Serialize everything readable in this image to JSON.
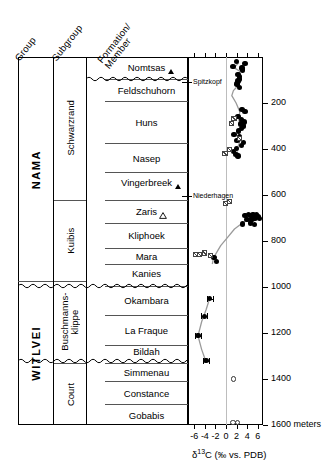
{
  "headers": {
    "group": "Group",
    "subgroup": "Subgroup",
    "formation_line1": "Formation/",
    "formation_line2": "Member"
  },
  "groups": [
    {
      "label": "NAMA",
      "top": 0,
      "bottom": 975
    },
    {
      "label": "WITLVEI",
      "top": 975,
      "bottom": 1600
    }
  ],
  "subgroups": [
    {
      "label": "Schwarzrand",
      "top": 0,
      "bottom": 620
    },
    {
      "label": "Kuibis",
      "top": 620,
      "bottom": 975
    },
    {
      "label": "Buschmanns-klippe",
      "top": 975,
      "bottom": 1330
    },
    {
      "label": "Court",
      "top": 1330,
      "bottom": 1600
    }
  ],
  "formations": [
    {
      "label": "Nomtsas",
      "top": 0,
      "bottom": 95,
      "marker": "triangle-filled"
    },
    {
      "label": "Feldschuhorn",
      "top": 95,
      "bottom": 190,
      "marker": "none"
    },
    {
      "label": "Huns",
      "top": 190,
      "bottom": 375,
      "marker": "none"
    },
    {
      "label": "Nasep",
      "top": 375,
      "bottom": 500,
      "marker": "none"
    },
    {
      "label": "Vingerbreek",
      "top": 500,
      "bottom": 590,
      "marker": "triangle-filled"
    },
    {
      "label": "Zaris",
      "top": 620,
      "bottom": 720,
      "marker": "triangle-open"
    },
    {
      "label": "Kliphoek",
      "top": 720,
      "bottom": 830,
      "marker": "none"
    },
    {
      "label": "Mara",
      "top": 830,
      "bottom": 900,
      "marker": "none"
    },
    {
      "label": "Kanies",
      "top": 900,
      "bottom": 975,
      "marker": "none"
    },
    {
      "label": "Okambara",
      "top": 995,
      "bottom": 1120,
      "marker": "none"
    },
    {
      "label": "La Fraque",
      "top": 1120,
      "bottom": 1250,
      "marker": "none"
    },
    {
      "label": "Bildah",
      "top": 1250,
      "bottom": 1310,
      "marker": "none"
    },
    {
      "label": "Simmenau",
      "top": 1330,
      "bottom": 1410,
      "marker": "none"
    },
    {
      "label": "Constance",
      "top": 1410,
      "bottom": 1510,
      "marker": "none"
    },
    {
      "label": "Gobabis",
      "top": 1510,
      "bottom": 1600,
      "marker": "none"
    }
  ],
  "unconformities": [
    {
      "name": "nomtsas-base-unconformity",
      "depth": 95
    },
    {
      "name": "okambara-base-unconformity",
      "depth": 995
    },
    {
      "name": "simmenau-base-unconformity",
      "depth": 1322
    }
  ],
  "annotations": [
    {
      "label": "Spitzkopf",
      "depth": 108
    },
    {
      "label": "Niederhagen",
      "depth": 605
    }
  ],
  "chart_data": {
    "type": "scatter",
    "title": "",
    "xlabel": "δ¹³C (‰ vs. PDB)",
    "ylabel": "meters",
    "xlim": [
      -7.2,
      7.0
    ],
    "ylim": [
      1600,
      0
    ],
    "xticks": [
      -6,
      -4,
      -2,
      0,
      2,
      4,
      6
    ],
    "yticks": [
      200,
      400,
      600,
      800,
      1000,
      1200,
      1400,
      1600
    ],
    "ytick_labels": [
      "200",
      "400",
      "600",
      "800",
      "1000",
      "1200",
      "1400",
      "1600 meters"
    ],
    "grid": false,
    "zero_reference_line": 0,
    "legend": [],
    "series": [
      {
        "name": "carbonate-d13c-filled",
        "symbol": "filled-circle",
        "points": [
          {
            "x": 2.0,
            "y": 20
          },
          {
            "x": 3.6,
            "y": 28
          },
          {
            "x": 1.3,
            "y": 42
          },
          {
            "x": 3.0,
            "y": 48
          },
          {
            "x": 3.1,
            "y": 57
          },
          {
            "x": 2.3,
            "y": 75
          },
          {
            "x": 2.6,
            "y": 86
          },
          {
            "x": 2.5,
            "y": 96
          },
          {
            "x": 2.3,
            "y": 104
          },
          {
            "x": 2.1,
            "y": 118
          },
          {
            "x": 2.5,
            "y": 132
          },
          {
            "x": 3.0,
            "y": 228
          },
          {
            "x": 3.6,
            "y": 238
          },
          {
            "x": 2.3,
            "y": 258
          },
          {
            "x": 2.9,
            "y": 272
          },
          {
            "x": 3.4,
            "y": 282
          },
          {
            "x": 2.7,
            "y": 292
          },
          {
            "x": 3.3,
            "y": 300
          },
          {
            "x": 2.9,
            "y": 310
          },
          {
            "x": 2.4,
            "y": 322
          },
          {
            "x": 1.5,
            "y": 338
          },
          {
            "x": 2.6,
            "y": 348
          },
          {
            "x": 2.1,
            "y": 362
          },
          {
            "x": 3.3,
            "y": 372
          },
          {
            "x": 2.9,
            "y": 386
          },
          {
            "x": 2.0,
            "y": 398
          },
          {
            "x": 1.4,
            "y": 412
          },
          {
            "x": 1.9,
            "y": 424
          },
          {
            "x": 2.3,
            "y": 430
          },
          {
            "x": 3.6,
            "y": 690
          },
          {
            "x": 4.2,
            "y": 686
          },
          {
            "x": 4.6,
            "y": 690
          },
          {
            "x": 5.1,
            "y": 684
          },
          {
            "x": 5.4,
            "y": 690
          },
          {
            "x": 5.8,
            "y": 686
          },
          {
            "x": 6.1,
            "y": 694
          },
          {
            "x": 4.0,
            "y": 706
          },
          {
            "x": 4.9,
            "y": 704
          },
          {
            "x": 5.5,
            "y": 700
          },
          {
            "x": 6.3,
            "y": 702
          },
          {
            "x": 3.1,
            "y": 726
          },
          {
            "x": 4.6,
            "y": 722
          },
          {
            "x": 5.4,
            "y": 728
          },
          {
            "x": -2.3,
            "y": 872
          },
          {
            "x": -1.8,
            "y": 888
          },
          {
            "x": -3.1,
            "y": 1050
          },
          {
            "x": -4.1,
            "y": 1128
          },
          {
            "x": -5.3,
            "y": 1212
          },
          {
            "x": -3.8,
            "y": 1320
          }
        ]
      },
      {
        "name": "carbonate-d13c-open",
        "symbol": "open-circle",
        "points": [
          {
            "x": 1.4,
            "y": 1400
          },
          {
            "x": 1.3,
            "y": 1590
          },
          {
            "x": 2.2,
            "y": 1590
          }
        ]
      },
      {
        "name": "organic-d13c-crossed-square",
        "symbol": "crossed-square",
        "points": [
          {
            "x": 1.5,
            "y": 268
          },
          {
            "x": 1.1,
            "y": 290
          },
          {
            "x": 2.5,
            "y": 356
          },
          {
            "x": 0.6,
            "y": 402
          },
          {
            "x": -0.2,
            "y": 420
          },
          {
            "x": -0.1,
            "y": 638
          },
          {
            "x": 0.6,
            "y": 628
          },
          {
            "x": -5.8,
            "y": 860
          },
          {
            "x": -5.0,
            "y": 860
          },
          {
            "x": -4.0,
            "y": 852
          },
          {
            "x": -2.9,
            "y": 862
          }
        ]
      }
    ],
    "error_bars": [
      {
        "x": -3.1,
        "y": 1050,
        "xerr": 0.55
      },
      {
        "x": -4.1,
        "y": 1128,
        "xerr": 0.55
      },
      {
        "x": -5.3,
        "y": 1212,
        "xerr": 0.65
      },
      {
        "x": -3.8,
        "y": 1320,
        "xerr": 0.6
      }
    ],
    "trend_lines": [
      {
        "name": "upper-trend",
        "points": [
          [
            2.0,
            14
          ],
          [
            2.3,
            28
          ],
          [
            1.5,
            46
          ],
          [
            2.6,
            62
          ],
          [
            2.3,
            84
          ],
          [
            2.0,
            104
          ],
          [
            2.3,
            124
          ],
          [
            1.4,
            146
          ],
          [
            1.1,
            168
          ],
          [
            1.9,
            200
          ],
          [
            2.6,
            238
          ],
          [
            2.4,
            272
          ],
          [
            2.9,
            300
          ],
          [
            2.4,
            334
          ],
          [
            2.6,
            368
          ],
          [
            2.1,
            400
          ],
          [
            2.0,
            428
          ]
        ]
      },
      {
        "name": "kuibis-trend",
        "points": [
          [
            6.2,
            682
          ],
          [
            5.2,
            694
          ],
          [
            4.2,
            706
          ],
          [
            3.1,
            722
          ],
          [
            1.6,
            748
          ],
          [
            0.3,
            784
          ],
          [
            -1.0,
            820
          ],
          [
            -2.0,
            858
          ],
          [
            -2.4,
            878
          ],
          [
            -2.6,
            900
          ]
        ]
      },
      {
        "name": "witlvei-trend",
        "points": [
          [
            -3.0,
            1042
          ],
          [
            -3.8,
            1100
          ],
          [
            -4.6,
            1150
          ],
          [
            -5.3,
            1212
          ],
          [
            -4.6,
            1272
          ],
          [
            -3.8,
            1325
          ]
        ]
      }
    ]
  }
}
